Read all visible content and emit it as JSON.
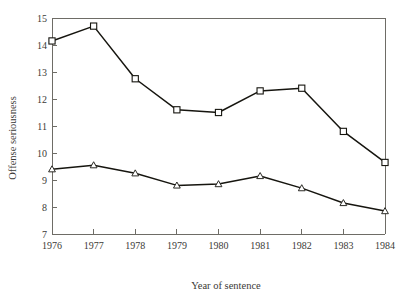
{
  "chart_data": {
    "type": "line",
    "title": "",
    "xlabel": "Year of sentence",
    "ylabel": "Offense seriousness",
    "categories": [
      "1976",
      "1977",
      "1978",
      "1979",
      "1980",
      "1981",
      "1982",
      "1983",
      "1984"
    ],
    "x": [
      1976,
      1977,
      1978,
      1979,
      1980,
      1981,
      1982,
      1983,
      1984
    ],
    "xlim": [
      1976,
      1984
    ],
    "ylim": [
      7,
      15
    ],
    "yticks": [
      7,
      8,
      9,
      10,
      11,
      12,
      13,
      14,
      15
    ],
    "ytick_labels": [
      "7",
      "8",
      "9",
      "10",
      "11",
      "12",
      "13",
      "14",
      "15"
    ],
    "xtick_labels": [
      "1976",
      "1977",
      "1978",
      "1979",
      "1980",
      "1981",
      "1982",
      "1983",
      "1984"
    ],
    "grid": false,
    "legend": "none",
    "series": [
      {
        "name": "upper-series",
        "marker": "square",
        "values": [
          14.15,
          14.7,
          12.75,
          11.6,
          11.5,
          12.3,
          12.4,
          10.8,
          9.65
        ]
      },
      {
        "name": "lower-series",
        "marker": "triangle",
        "values": [
          9.4,
          9.55,
          9.25,
          8.8,
          8.85,
          9.15,
          8.7,
          8.15,
          7.85
        ]
      }
    ]
  },
  "colors": {
    "line": "#16150f",
    "axis": "#6e6c66",
    "text": "#3b3a36",
    "background": "#ffffff"
  }
}
